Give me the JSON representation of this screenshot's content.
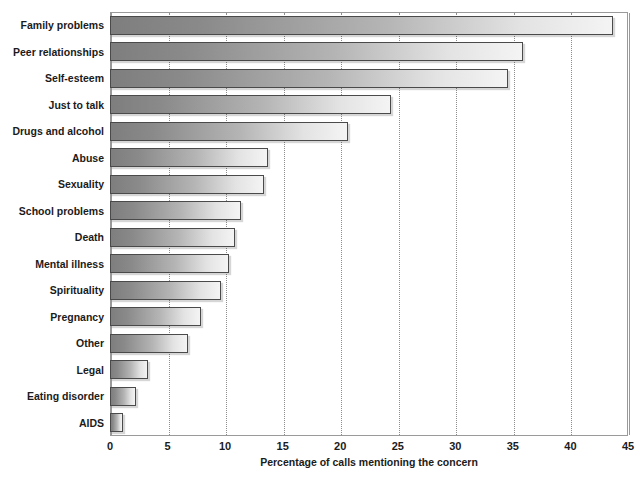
{
  "chart_data": {
    "type": "bar",
    "orientation": "horizontal",
    "title": "",
    "xlabel": "Percentage of calls mentioning the concern",
    "ylabel": "",
    "xlim": [
      0,
      45
    ],
    "xticks": [
      0,
      5,
      10,
      15,
      20,
      25,
      30,
      35,
      40,
      45
    ],
    "grid": "vertical-dotted",
    "legend": "none",
    "categories": [
      "Family problems",
      "Peer relationships",
      "Self-esteem",
      "Just to talk",
      "Drugs and alcohol",
      "Abuse",
      "Sexuality",
      "School problems",
      "Death",
      "Mental illness",
      "Spirituality",
      "Pregnancy",
      "Other",
      "Legal",
      "Eating disorder",
      "AIDS"
    ],
    "values": [
      43.7,
      35.9,
      34.6,
      24.4,
      20.7,
      13.7,
      13.4,
      11.4,
      10.9,
      10.3,
      9.6,
      7.9,
      6.8,
      3.3,
      2.3,
      1.1
    ],
    "colors": {
      "bar_gradient_start": "#7e7e7e",
      "bar_gradient_end": "#f4f4f4",
      "bar_border": "#4a4a4a",
      "gridline": "#8d8d8d",
      "frame": "#9a9a9a",
      "text": "#1b1b1b",
      "background": "#ffffff"
    }
  }
}
